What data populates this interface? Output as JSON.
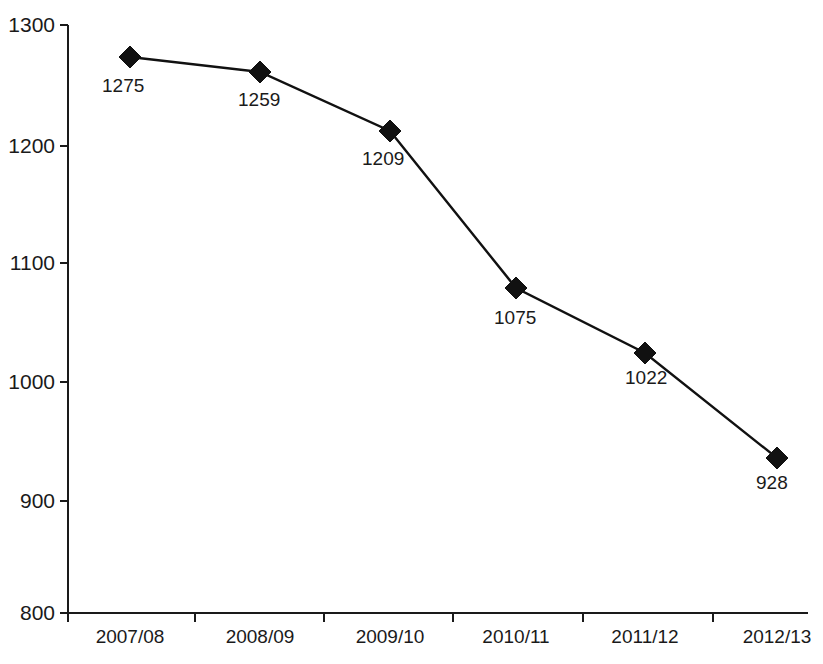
{
  "chart_data": {
    "type": "line",
    "title": "",
    "subtitle": "",
    "xlabel": "",
    "ylabel": "",
    "categories": [
      "2007/08",
      "2008/09",
      "2009/10",
      "2010/11",
      "2011/12",
      "2012/13"
    ],
    "values": [
      1275,
      1259,
      1209,
      1075,
      1022,
      928
    ],
    "series": [
      {
        "name": "",
        "values": [
          1275,
          1259,
          1209,
          1075,
          1022,
          928
        ]
      }
    ],
    "data_labels": [
      "1275",
      "1259",
      "1209",
      "1075",
      "1022",
      "928"
    ],
    "ylim": [
      800,
      1300
    ],
    "yticks": [
      800,
      900,
      1000,
      1100,
      1200,
      1300
    ],
    "ytick_labels": [
      "800",
      "900",
      "1000",
      "1100",
      "1200",
      "1300"
    ],
    "grid": false,
    "legend": false,
    "legend_position": "none",
    "marker": "diamond",
    "marker_color": "#111111",
    "line_color": "#111111",
    "axis_color": "#1a1a1a",
    "background_color": "#ffffff"
  },
  "layout": {
    "plot_left": 68,
    "plot_right": 808,
    "plot_top": 25,
    "plot_bottom": 613,
    "x_tick_positions": [
      68,
      195,
      324,
      453,
      583,
      713
    ],
    "x_label_positions": [
      130,
      260,
      390,
      516,
      645,
      777
    ],
    "y_tick_positions": [
      613,
      501,
      382,
      263,
      146,
      25
    ],
    "point_positions": [
      {
        "x": 130,
        "y": 57
      },
      {
        "x": 260,
        "y": 72
      },
      {
        "x": 390,
        "y": 131
      },
      {
        "x": 516,
        "y": 288
      },
      {
        "x": 645,
        "y": 353
      },
      {
        "x": 777,
        "y": 458
      }
    ],
    "label_anchors": [
      {
        "x": 102,
        "y": 78,
        "anchor": "start"
      },
      {
        "x": 238,
        "y": 92,
        "anchor": "start"
      },
      {
        "x": 362,
        "y": 151,
        "anchor": "start"
      },
      {
        "x": 494,
        "y": 310,
        "anchor": "start"
      },
      {
        "x": 625,
        "y": 370,
        "anchor": "start"
      },
      {
        "x": 756,
        "y": 475,
        "anchor": "start"
      }
    ],
    "marker_size": 11
  }
}
